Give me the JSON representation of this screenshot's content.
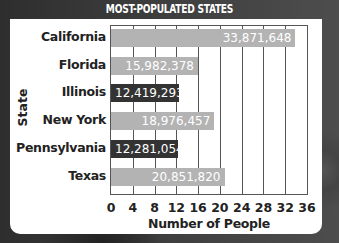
{
  "chart_data": {
    "type": "bar",
    "orientation": "horizontal",
    "title": "MOST-POPULATED STATES",
    "xlabel": "Number of People",
    "ylabel": "State",
    "categories": [
      "California",
      "Florida",
      "Illinois",
      "New York",
      "Pennsylvania",
      "Texas"
    ],
    "values": [
      33871648,
      15982378,
      12419293,
      18976457,
      12281054,
      20851820
    ],
    "value_labels": [
      "33,871,648",
      "15,982,378",
      "12,419,293",
      "18,976,457",
      "12,281,054",
      "20,851,820"
    ],
    "bar_shades": [
      "light",
      "light",
      "dark",
      "light",
      "dark",
      "light"
    ],
    "xticks": [
      "0",
      "4",
      "8",
      "12",
      "16",
      "20",
      "24",
      "28",
      "32",
      "36"
    ],
    "xlim": [
      0,
      36
    ],
    "x_unit_note": "axis ticks in millions",
    "grid": true
  },
  "colors": {
    "bar_light": "#b3b3b3",
    "bar_dark": "#333333",
    "title_bar": "#3a3a3a",
    "panel": "#ffffff"
  }
}
